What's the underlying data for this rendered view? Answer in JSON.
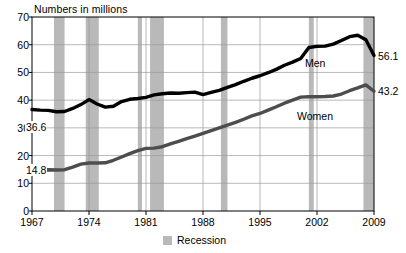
{
  "chart_data": {
    "type": "line",
    "title": "Numbers in millions",
    "xlabel": "",
    "ylabel": "Numbers in millions",
    "ylim": [
      0,
      70
    ],
    "xlim": [
      1967,
      2009
    ],
    "grid": true,
    "legend_position": "bottom-center",
    "yticks": [
      70,
      60,
      50,
      40,
      30,
      20,
      10,
      0
    ],
    "xticks": [
      1967,
      1974,
      1981,
      1988,
      1995,
      2002,
      2009
    ],
    "x": [
      1967,
      1968,
      1969,
      1970,
      1971,
      1972,
      1973,
      1974,
      1975,
      1976,
      1977,
      1978,
      1979,
      1980,
      1981,
      1982,
      1983,
      1984,
      1985,
      1986,
      1987,
      1988,
      1989,
      1990,
      1991,
      1992,
      1993,
      1994,
      1995,
      1996,
      1997,
      1998,
      1999,
      2000,
      2001,
      2002,
      2003,
      2004,
      2005,
      2006,
      2007,
      2008,
      2009
    ],
    "series": [
      {
        "name": "Men",
        "color": "#000000",
        "start_label": "36.6",
        "end_label": "56.1",
        "values": [
          36.6,
          36.4,
          36.3,
          35.8,
          35.9,
          37.0,
          38.4,
          40.2,
          38.6,
          37.5,
          37.8,
          39.5,
          40.3,
          40.6,
          41.0,
          41.9,
          42.3,
          42.6,
          42.5,
          42.7,
          42.9,
          42.0,
          42.8,
          43.5,
          44.6,
          45.6,
          46.8,
          47.9,
          48.8,
          49.9,
          51.1,
          52.6,
          53.7,
          55.0,
          59.0,
          59.4,
          59.5,
          60.2,
          61.5,
          62.9,
          63.4,
          61.8,
          56.1
        ]
      },
      {
        "name": "Women",
        "color": "#4d4d4d",
        "start_label": "14.8",
        "end_label": "43.2",
        "values": [
          14.8,
          14.8,
          14.9,
          14.8,
          14.9,
          15.8,
          16.9,
          17.3,
          17.3,
          17.4,
          18.3,
          19.5,
          20.7,
          21.8,
          22.6,
          22.7,
          23.2,
          24.2,
          25.1,
          26.1,
          27.0,
          28.0,
          29.0,
          30.0,
          31.0,
          32.0,
          33.1,
          34.3,
          35.2,
          36.4,
          37.6,
          38.9,
          40.0,
          41.1,
          41.2,
          41.2,
          41.3,
          41.5,
          42.2,
          43.4,
          44.4,
          45.5,
          43.2
        ]
      }
    ],
    "recession_bands": [
      {
        "start": 1969.7,
        "end": 1971.0
      },
      {
        "start": 1973.6,
        "end": 1975.2
      },
      {
        "start": 1980.0,
        "end": 1980.5
      },
      {
        "start": 1981.5,
        "end": 1983.2
      },
      {
        "start": 1990.2,
        "end": 1991.0
      },
      {
        "start": 2001.0,
        "end": 2001.6
      },
      {
        "start": 2007.7,
        "end": 2009.3
      }
    ],
    "recession_color": "#b9b9b9"
  },
  "legend": {
    "recession_label": "Recession"
  }
}
